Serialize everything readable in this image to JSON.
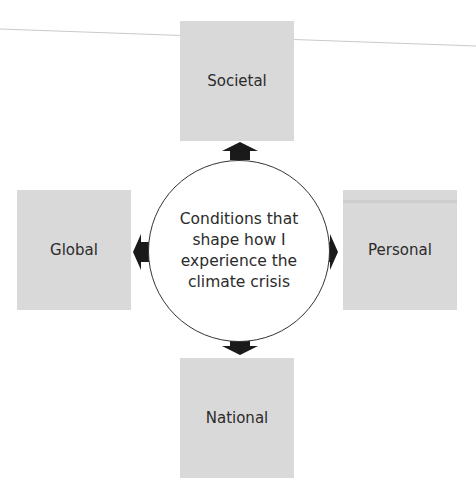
{
  "diagram": {
    "center": {
      "label": "Conditions that\nshape how I\nexperience the\nclimate crisis"
    },
    "nodes": [
      {
        "id": "societal",
        "label": "Societal",
        "position": "top"
      },
      {
        "id": "personal",
        "label": "Personal",
        "position": "right"
      },
      {
        "id": "national",
        "label": "National",
        "position": "bottom"
      },
      {
        "id": "global",
        "label": "Global",
        "position": "left"
      }
    ],
    "arrows": [
      {
        "from": "center",
        "to": "societal",
        "direction": "up"
      },
      {
        "from": "center",
        "to": "personal",
        "direction": "right"
      },
      {
        "from": "center",
        "to": "national",
        "direction": "down"
      },
      {
        "from": "center",
        "to": "global",
        "direction": "left"
      }
    ],
    "colors": {
      "box_fill": "#d9d9d9",
      "arrow_fill": "#1a1a1a",
      "circle_stroke": "#333333",
      "text": "#2b2b2b"
    }
  }
}
